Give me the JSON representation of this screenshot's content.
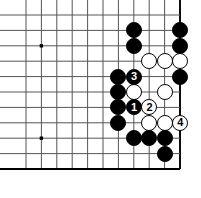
{
  "figure": {
    "kind": "go-board-diagram",
    "width": 201,
    "height": 198,
    "background_color": "#ffffff"
  },
  "board": {
    "line_color": "#555555",
    "edge_color": "#000000",
    "star_point_color": "#000000",
    "origin_x": 26,
    "origin_y": 15,
    "spacing": 15.4,
    "cols": 11,
    "rows": 11,
    "edges": {
      "right": true,
      "bottom": true,
      "top": false,
      "left": false
    },
    "star_points": [
      {
        "col": 1,
        "row": 2
      },
      {
        "col": 1,
        "row": 8
      },
      {
        "col": 7,
        "row": 8
      }
    ]
  },
  "stones": [
    {
      "id": "b-c7r1",
      "color": "black",
      "col": 7,
      "row": 1,
      "label": ""
    },
    {
      "id": "b-c10r1",
      "color": "black",
      "col": 10,
      "row": 1,
      "label": ""
    },
    {
      "id": "b-c7r2",
      "color": "black",
      "col": 7,
      "row": 2,
      "label": ""
    },
    {
      "id": "b-c10r2",
      "color": "black",
      "col": 10,
      "row": 2,
      "label": ""
    },
    {
      "id": "w-c8r3",
      "color": "white",
      "col": 8,
      "row": 3,
      "label": ""
    },
    {
      "id": "w-c9r3",
      "color": "white",
      "col": 9,
      "row": 3,
      "label": ""
    },
    {
      "id": "w-c10r3",
      "color": "white",
      "col": 10,
      "row": 3,
      "label": ""
    },
    {
      "id": "b-c6r4",
      "color": "black",
      "col": 6,
      "row": 4,
      "label": ""
    },
    {
      "id": "b-c7r4-move3",
      "color": "black",
      "col": 7,
      "row": 4,
      "label": "3"
    },
    {
      "id": "b-c10r4",
      "color": "black",
      "col": 10,
      "row": 4,
      "label": ""
    },
    {
      "id": "b-c6r5",
      "color": "black",
      "col": 6,
      "row": 5,
      "label": ""
    },
    {
      "id": "w-c7r5",
      "color": "white",
      "col": 7,
      "row": 5,
      "label": ""
    },
    {
      "id": "w-c9r5",
      "color": "white",
      "col": 9,
      "row": 5,
      "label": ""
    },
    {
      "id": "b-c6r6",
      "color": "black",
      "col": 6,
      "row": 6,
      "label": ""
    },
    {
      "id": "b-c7r6-move1",
      "color": "black",
      "col": 7,
      "row": 6,
      "label": "1"
    },
    {
      "id": "w-c8r6-move2",
      "color": "white",
      "col": 8,
      "row": 6,
      "label": "2"
    },
    {
      "id": "b-c6r7",
      "color": "black",
      "col": 6,
      "row": 7,
      "label": ""
    },
    {
      "id": "w-c8r7",
      "color": "white",
      "col": 8,
      "row": 7,
      "label": ""
    },
    {
      "id": "w-c9r7",
      "color": "white",
      "col": 9,
      "row": 7,
      "label": ""
    },
    {
      "id": "w-c10r7-move4",
      "color": "white",
      "col": 10,
      "row": 7,
      "label": "4"
    },
    {
      "id": "b-c7r8",
      "color": "black",
      "col": 7,
      "row": 8,
      "label": ""
    },
    {
      "id": "b-c8r8",
      "color": "black",
      "col": 8,
      "row": 8,
      "label": ""
    },
    {
      "id": "b-c9r8",
      "color": "black",
      "col": 9,
      "row": 8,
      "label": ""
    },
    {
      "id": "b-c9r9",
      "color": "black",
      "col": 9,
      "row": 9,
      "label": ""
    }
  ],
  "move_sequence": [
    {
      "number": "1",
      "color": "black"
    },
    {
      "number": "2",
      "color": "white"
    },
    {
      "number": "3",
      "color": "black"
    },
    {
      "number": "4",
      "color": "white"
    }
  ]
}
